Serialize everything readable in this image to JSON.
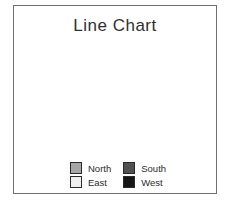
{
  "window": {
    "background": "#ffffff",
    "border_color": "#6f6f6f"
  },
  "chart_data": {
    "type": "line",
    "style": "3d-ribbon",
    "title": "Line Chart",
    "categories": [
      "1st Qtr",
      "2nd Qtr",
      "3rd Qtr",
      "4th Qtr"
    ],
    "series": [
      {
        "name": "North",
        "values": [
          104,
          60,
          81,
          93
        ],
        "color_top": "#a6a6a6",
        "color_front": "#7a7a7a",
        "color_cap": "#8f8f8f"
      },
      {
        "name": "South",
        "values": [
          44,
          40,
          47,
          68
        ],
        "color_top": "#5f5f5f",
        "color_front": "#343434",
        "color_cap": "#484848"
      },
      {
        "name": "East",
        "values": [
          24,
          29,
          41,
          25
        ],
        "color_top": "#f1f1f1",
        "color_front": "#d2d2d2",
        "color_cap": "#e2e2e2"
      },
      {
        "name": "West",
        "values": [
          7,
          16,
          28,
          43
        ],
        "color_top": "#2f2f2f",
        "color_front": "#0a0a0a",
        "color_cap": "#1d1d1d"
      }
    ],
    "xlabel": "",
    "ylabel": "",
    "ylim": [
      0,
      100
    ],
    "ytick_step": 20,
    "yticks": [
      "0",
      "20",
      "40",
      "60",
      "80",
      "100"
    ],
    "grid": true,
    "legend_position": "bottom",
    "colors": {
      "grid": "#9a9a9a",
      "wall": "#8a8a8a",
      "axis": "#3c3c3c",
      "tick_text": "#2b2b2b",
      "title_text": "#2f2f2f"
    }
  },
  "legend": {
    "items": [
      {
        "label": "North",
        "color": "#a6a6a6"
      },
      {
        "label": "East",
        "color": "#f0f0f0"
      },
      {
        "label": "South",
        "color": "#515151"
      },
      {
        "label": "West",
        "color": "#161616"
      }
    ]
  }
}
